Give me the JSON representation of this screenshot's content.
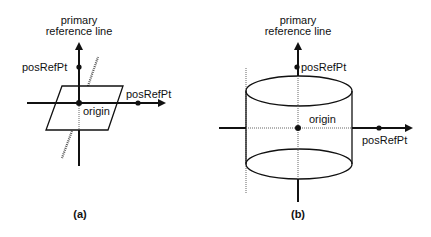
{
  "diagrams": [
    {
      "id": "a",
      "caption": "(a)",
      "axis_label_line1": "primary",
      "axis_label_line2": "reference line",
      "pos_ref_pt_vertical": "posRefPt",
      "pos_ref_pt_horizontal": "posRefPt",
      "origin_label": "origin",
      "shape": "plane"
    },
    {
      "id": "b",
      "caption": "(b)",
      "axis_label_line1": "primary",
      "axis_label_line2": "reference line",
      "pos_ref_pt_vertical": "posRefPt",
      "pos_ref_pt_horizontal": "posRefPt",
      "origin_label": "origin",
      "shape": "cylinder"
    }
  ]
}
